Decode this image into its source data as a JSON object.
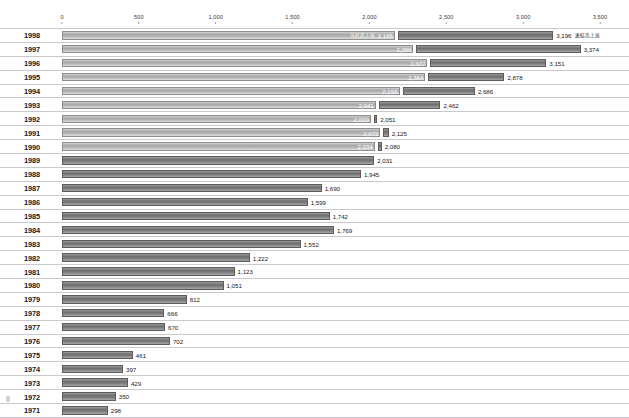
{
  "chart_data": {
    "type": "bar",
    "orientation": "horizontal",
    "title": "",
    "xlabel": "",
    "ylabel": "",
    "xlim": [
      0,
      3500
    ],
    "grid": false,
    "legend_position": "inline-first-row",
    "axis_ticks": [
      "0",
      "500",
      "1,000",
      "1,500",
      "2,000",
      "2,500",
      "3,000",
      "3,500"
    ],
    "axis_tick_values": [
      0,
      500,
      1000,
      1500,
      2000,
      2500,
      3000,
      3500
    ],
    "series": [
      {
        "name": "当社売上高",
        "key": "company"
      },
      {
        "name": "連結売上高",
        "key": "consolidated"
      }
    ],
    "categories": [
      "1998",
      "1997",
      "1996",
      "1995",
      "1994",
      "1993",
      "1992",
      "1991",
      "1990",
      "1989",
      "1988",
      "1987",
      "1986",
      "1985",
      "1984",
      "1983",
      "1982",
      "1981",
      "1980",
      "1979",
      "1978",
      "1977",
      "1976",
      "1975",
      "1974",
      "1973",
      "1972",
      "1971"
    ],
    "rows": [
      {
        "year": "1998",
        "company": 2166,
        "company_label": "2,166",
        "consolidated": 3196,
        "consolidated_label": "3,196",
        "series_note_left": "当社売上高",
        "series_note_right": "連結売上高"
      },
      {
        "year": "1997",
        "company": 2286,
        "company_label": "2,286",
        "consolidated": 3374,
        "consolidated_label": "3,374"
      },
      {
        "year": "1996",
        "company": 2377,
        "company_label": "2,377",
        "consolidated": 3151,
        "consolidated_label": "3,151"
      },
      {
        "year": "1995",
        "company": 2364,
        "company_label": "2,364",
        "consolidated": 2878,
        "consolidated_label": "2,878"
      },
      {
        "year": "1994",
        "company": 2196,
        "company_label": "2,196",
        "consolidated": 2686,
        "consolidated_label": "2,686"
      },
      {
        "year": "1993",
        "company": 2041,
        "company_label": "2,041",
        "consolidated": 2462,
        "consolidated_label": "2,462"
      },
      {
        "year": "1992",
        "company": 2009,
        "company_label": "2,009",
        "consolidated": 2051,
        "consolidated_label": "2,051"
      },
      {
        "year": "1991",
        "company": 2072,
        "company_label": "2,072",
        "consolidated": 2125,
        "consolidated_label": "2,125"
      },
      {
        "year": "1990",
        "company": 2034,
        "company_label": "2,034",
        "consolidated": 2080,
        "consolidated_label": "2,080"
      },
      {
        "year": "1989",
        "company": null,
        "company_label": "",
        "consolidated": 2031,
        "consolidated_label": "2,031"
      },
      {
        "year": "1988",
        "company": null,
        "company_label": "",
        "consolidated": 1945,
        "consolidated_label": "1,945"
      },
      {
        "year": "1987",
        "company": null,
        "company_label": "",
        "consolidated": 1690,
        "consolidated_label": "1,690"
      },
      {
        "year": "1986",
        "company": null,
        "company_label": "",
        "consolidated": 1599,
        "consolidated_label": "1,599"
      },
      {
        "year": "1985",
        "company": null,
        "company_label": "",
        "consolidated": 1742,
        "consolidated_label": "1,742"
      },
      {
        "year": "1984",
        "company": null,
        "company_label": "",
        "consolidated": 1769,
        "consolidated_label": "1,769"
      },
      {
        "year": "1983",
        "company": null,
        "company_label": "",
        "consolidated": 1552,
        "consolidated_label": "1,552"
      },
      {
        "year": "1982",
        "company": null,
        "company_label": "",
        "consolidated": 1222,
        "consolidated_label": "1,222"
      },
      {
        "year": "1981",
        "company": null,
        "company_label": "",
        "consolidated": 1123,
        "consolidated_label": "1,123"
      },
      {
        "year": "1980",
        "company": null,
        "company_label": "",
        "consolidated": 1051,
        "consolidated_label": "1,051"
      },
      {
        "year": "1979",
        "company": null,
        "company_label": "",
        "consolidated": 812,
        "consolidated_label": "812"
      },
      {
        "year": "1978",
        "company": null,
        "company_label": "",
        "consolidated": 666,
        "consolidated_label": "666"
      },
      {
        "year": "1977",
        "company": null,
        "company_label": "",
        "consolidated": 670,
        "consolidated_label": "670"
      },
      {
        "year": "1976",
        "company": null,
        "company_label": "",
        "consolidated": 702,
        "consolidated_label": "702"
      },
      {
        "year": "1975",
        "company": null,
        "company_label": "",
        "consolidated": 461,
        "consolidated_label": "461"
      },
      {
        "year": "1974",
        "company": null,
        "company_label": "",
        "consolidated": 397,
        "consolidated_label": "397"
      },
      {
        "year": "1973",
        "company": null,
        "company_label": "",
        "consolidated": 429,
        "consolidated_label": "429"
      },
      {
        "year": "1972",
        "company": null,
        "company_label": "",
        "consolidated": 350,
        "consolidated_label": "350"
      },
      {
        "year": "1971",
        "company": null,
        "company_label": "",
        "consolidated": 298,
        "consolidated_label": "298"
      }
    ],
    "colors": {
      "company_bar": "#a7a7a7",
      "consolidated_bar": "#6f6f6f",
      "rule": "#c9c9cb",
      "text": "#231f20"
    }
  }
}
